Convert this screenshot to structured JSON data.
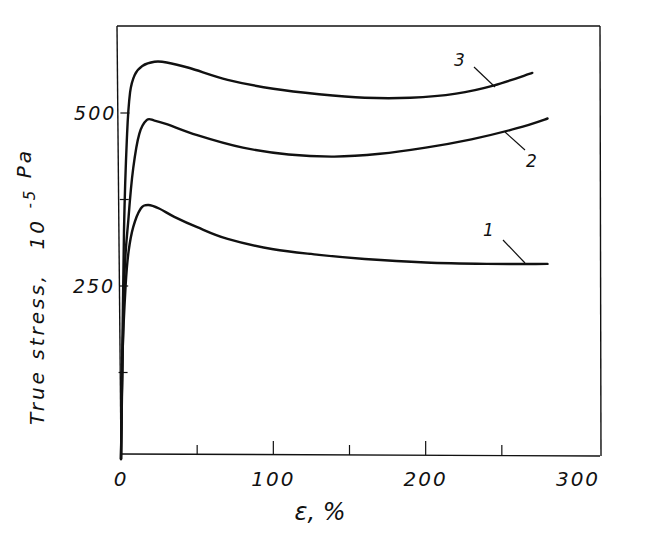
{
  "chart_data": {
    "type": "line",
    "title": "",
    "xlabel": "ε, %",
    "ylabel": "True stress, 10⁻⁵ Pa",
    "ylabel_main": "True stress,",
    "ylabel_unit_base": "10",
    "ylabel_unit_exp": "-5",
    "ylabel_unit_tail": "Pa",
    "xlim": [
      0,
      300
    ],
    "ylim": [
      0,
      640
    ],
    "x_ticks": [
      0,
      50,
      100,
      150,
      200,
      250,
      300
    ],
    "x_tick_labels": [
      "0",
      "",
      "100",
      "",
      "200",
      "",
      "300"
    ],
    "y_ticks": [
      125,
      250,
      375,
      500
    ],
    "y_tick_labels": [
      "",
      "250",
      "",
      "500"
    ],
    "grid": false,
    "legend": "inline numeric labels",
    "series": [
      {
        "name": "1",
        "label": "1",
        "x": [
          0,
          1,
          3,
          5,
          8,
          13,
          18,
          25,
          35,
          50,
          70,
          100,
          130,
          160,
          200,
          240,
          280
        ],
        "values": [
          0,
          150,
          250,
          300,
          335,
          362,
          367,
          362,
          350,
          335,
          318,
          303,
          295,
          289,
          284,
          282,
          282
        ]
      },
      {
        "name": "2",
        "label": "2",
        "x": [
          0,
          2,
          5,
          8,
          12,
          17,
          22,
          30,
          50,
          80,
          110,
          140,
          170,
          200,
          230,
          260,
          280
        ],
        "values": [
          0,
          250,
          350,
          420,
          470,
          490,
          489,
          484,
          468,
          450,
          440,
          437,
          441,
          450,
          462,
          478,
          492
        ]
      },
      {
        "name": "3",
        "label": "3",
        "x": [
          0,
          2,
          4,
          6,
          9,
          14,
          22,
          30,
          45,
          70,
          100,
          130,
          160,
          190,
          220,
          245,
          270
        ],
        "values": [
          0,
          330,
          470,
          530,
          555,
          568,
          574,
          573,
          565,
          548,
          535,
          527,
          522,
          522,
          528,
          540,
          558
        ]
      }
    ],
    "annotations": [
      {
        "text": "1",
        "series": "1"
      },
      {
        "text": "2",
        "series": "2"
      },
      {
        "text": "3",
        "series": "3"
      }
    ]
  }
}
